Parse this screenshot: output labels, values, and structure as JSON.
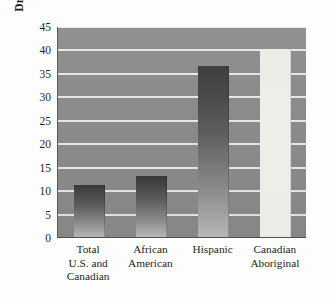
{
  "chart_data": {
    "type": "bar",
    "title": "",
    "xlabel": "",
    "ylabel": "Dropout Rates (percentage)",
    "categories": [
      "Total\nU.S. and\nCanadian",
      "African\nAmerican",
      "Hispanic",
      "Canadian\nAboriginal"
    ],
    "values": [
      11,
      13,
      36.5,
      40
    ],
    "ylim": [
      0,
      45
    ],
    "yticks": [
      0,
      5,
      10,
      15,
      20,
      25,
      30,
      35,
      40,
      45
    ],
    "ytick_labels": [
      "0",
      "5",
      "10",
      "15",
      "20",
      "25",
      "30",
      "35",
      "40",
      "45"
    ],
    "grid": true,
    "legend": "none",
    "bar_styles": [
      "dark",
      "dark",
      "dark",
      "light"
    ],
    "colors": {
      "plot_background": "#8b8b8b",
      "gridline": "#efeeec",
      "bar_dark_top": "#3a3a3a",
      "bar_dark_bottom": "#bdbdbd",
      "bar_light": "#f2f0eb",
      "axis": "#4f4f4f",
      "text": "#1e1e1e",
      "page_background": "#fdfdfd"
    }
  }
}
